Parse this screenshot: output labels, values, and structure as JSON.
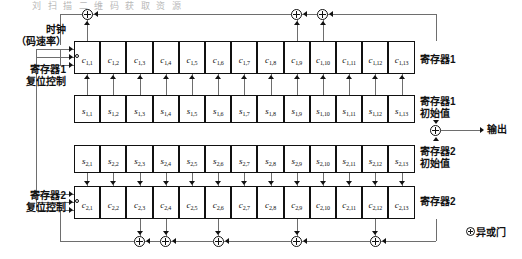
{
  "figure": {
    "title_fragment": "刘 扫 描 二 维 码    获 取 资 源",
    "kind": "gold-code-generator-block-diagram"
  },
  "labels": {
    "clock": "时钟",
    "clock_rate": "（码速率）",
    "reg1_reset": "寄存器1",
    "reg1_reset2": "复位控制",
    "reg2_reset": "寄存器2",
    "reg2_reset2": "复位控制",
    "register1": "寄存器1",
    "register1_init_a": "寄存器1",
    "register1_init_b": "初始值",
    "register2_init_a": "寄存器2",
    "register2_init_b": "初始值",
    "register2": "寄存器2",
    "output": "输出",
    "legend_xor": "异或门"
  },
  "registers": {
    "c1": {
      "name": "寄存器1",
      "symbol": "c",
      "row": 1,
      "cells": [
        {
          "base": "c",
          "sub": "1,1"
        },
        {
          "base": "c",
          "sub": "1,2"
        },
        {
          "base": "c",
          "sub": "1,3"
        },
        {
          "base": "c",
          "sub": "1,4"
        },
        {
          "base": "c",
          "sub": "1,5"
        },
        {
          "base": "c",
          "sub": "1,6"
        },
        {
          "base": "c",
          "sub": "1,7"
        },
        {
          "base": "c",
          "sub": "1,8"
        },
        {
          "base": "c",
          "sub": "1,9"
        },
        {
          "base": "c",
          "sub": "1,10"
        },
        {
          "base": "c",
          "sub": "1,11"
        },
        {
          "base": "c",
          "sub": "1,12"
        },
        {
          "base": "c",
          "sub": "1,13"
        }
      ]
    },
    "s1": {
      "name": "寄存器1初始值",
      "symbol": "s",
      "row": 1,
      "cells": [
        {
          "base": "s",
          "sub": "1,1"
        },
        {
          "base": "s",
          "sub": "1,2"
        },
        {
          "base": "s",
          "sub": "1,3"
        },
        {
          "base": "s",
          "sub": "1,4"
        },
        {
          "base": "s",
          "sub": "1,5"
        },
        {
          "base": "s",
          "sub": "1,6"
        },
        {
          "base": "s",
          "sub": "1,7"
        },
        {
          "base": "s",
          "sub": "1,8"
        },
        {
          "base": "s",
          "sub": "1,9"
        },
        {
          "base": "s",
          "sub": "1,10"
        },
        {
          "base": "s",
          "sub": "1,11"
        },
        {
          "base": "s",
          "sub": "1,12"
        },
        {
          "base": "s",
          "sub": "1,13"
        }
      ]
    },
    "s2": {
      "name": "寄存器2初始值",
      "symbol": "s",
      "row": 2,
      "cells": [
        {
          "base": "s",
          "sub": "2,1"
        },
        {
          "base": "s",
          "sub": "2,2"
        },
        {
          "base": "s",
          "sub": "2,3"
        },
        {
          "base": "s",
          "sub": "2,4"
        },
        {
          "base": "s",
          "sub": "2,5"
        },
        {
          "base": "s",
          "sub": "2,6"
        },
        {
          "base": "s",
          "sub": "2,7"
        },
        {
          "base": "s",
          "sub": "2,8"
        },
        {
          "base": "s",
          "sub": "2,9"
        },
        {
          "base": "s",
          "sub": "2,10"
        },
        {
          "base": "s",
          "sub": "2,11"
        },
        {
          "base": "s",
          "sub": "2,12"
        },
        {
          "base": "s",
          "sub": "2,13"
        }
      ]
    },
    "c2": {
      "name": "寄存器2",
      "symbol": "c",
      "row": 2,
      "cells": [
        {
          "base": "c",
          "sub": "2,1"
        },
        {
          "base": "c",
          "sub": "2,2"
        },
        {
          "base": "c",
          "sub": "2,3"
        },
        {
          "base": "c",
          "sub": "2,4"
        },
        {
          "base": "c",
          "sub": "2,5"
        },
        {
          "base": "c",
          "sub": "2,6"
        },
        {
          "base": "c",
          "sub": "2,7"
        },
        {
          "base": "c",
          "sub": "2,8"
        },
        {
          "base": "c",
          "sub": "2,9"
        },
        {
          "base": "c",
          "sub": "2,10"
        },
        {
          "base": "c",
          "sub": "2,11"
        },
        {
          "base": "c",
          "sub": "2,12"
        },
        {
          "base": "c",
          "sub": "2,13"
        }
      ]
    }
  },
  "taps": {
    "top_xor_tap_stages": [
      1,
      9,
      10
    ],
    "bottom_xor_tap_stages": [
      3,
      4,
      6,
      9,
      12
    ]
  },
  "colors": {
    "line": "#6e6e6e",
    "ink": "#111111",
    "box_border": "#111111",
    "background": "#ffffff"
  }
}
